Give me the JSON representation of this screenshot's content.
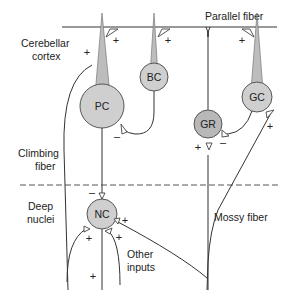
{
  "diagram": {
    "regions": {
      "cortex": "Cerebellar cortex",
      "cortex_line1": "Cerebellar",
      "cortex_line2": "cortex",
      "deep_line1": "Deep",
      "deep_line2": "nuclei"
    },
    "fibers": {
      "parallel": "Parallel fiber",
      "climbing_line1": "Climbing",
      "climbing_line2": "fiber",
      "mossy": "Mossy fiber",
      "other_line1": "Other",
      "other_line2": "inputs"
    },
    "cells": {
      "pc": "PC",
      "bc": "BC",
      "gr": "GR",
      "gc": "GC",
      "nc": "NC"
    },
    "signs": {
      "plus": "+",
      "minus": "–"
    },
    "colors": {
      "soma_fill": "#cfcfcf",
      "gr_fill": "#b8b8b8",
      "line": "#333333"
    }
  }
}
